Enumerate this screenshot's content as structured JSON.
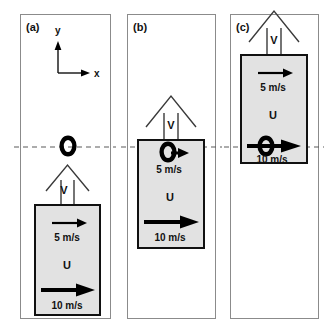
{
  "figure": {
    "background_color": "#ffffff",
    "panel_border_color": "#8b8b8b",
    "train_fill_color": "#e2e2e2",
    "train_border_color": "#111111",
    "dashed_line_color": "#5a5a5a",
    "ink_color": "#000000"
  },
  "axes": {
    "y_label": "y",
    "x_label": "x"
  },
  "panels": [
    {
      "label": "(a)",
      "frame_label": "V",
      "train_label": "U",
      "observer_icon": "ring-icon",
      "observer_has_arrow": false,
      "observer_speed": "",
      "inner_speed": "5 m/s",
      "outer_speed": "10 m/s",
      "description": "Ground frame: observer ring sits on the dashed axis line above the train"
    },
    {
      "label": "(b)",
      "frame_label": "V",
      "train_label": "U",
      "observer_icon": "ring-icon",
      "observer_has_arrow": true,
      "observer_speed": "5 m/s",
      "inner_speed": "5 m/s",
      "outer_speed": "10 m/s",
      "description": "Frame moving with the walker: ring with arrow at the dashed line near the train top"
    },
    {
      "label": "(c)",
      "frame_label": "V",
      "train_label": "U",
      "observer_icon": "ring-icon",
      "observer_has_arrow": true,
      "observer_speed": "10 m/s",
      "inner_speed": "5 m/s",
      "outer_speed": "10 m/s",
      "description": "Frame moving with the train: ring with long arrow at the dashed line inside the train"
    }
  ]
}
